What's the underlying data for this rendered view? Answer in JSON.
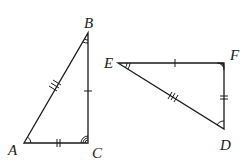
{
  "figure": {
    "triangle_1": {
      "name": "ABC",
      "vertices": {
        "A": {
          "label": "A",
          "x": 24,
          "y": 143
        },
        "B": {
          "label": "B",
          "x": 88,
          "y": 33
        },
        "C": {
          "label": "C",
          "x": 88,
          "y": 143
        }
      },
      "side_ticks": {
        "AB": 3,
        "BC": 1,
        "AC": 2
      },
      "angle_arcs": {
        "A": 1,
        "B": 1,
        "C": 3
      }
    },
    "triangle_2": {
      "name": "EFD",
      "vertices": {
        "E": {
          "label": "E",
          "x": 118,
          "y": 63
        },
        "F": {
          "label": "F",
          "x": 224,
          "y": 63
        },
        "D": {
          "label": "D",
          "x": 224,
          "y": 129
        }
      },
      "side_ticks": {
        "EF": 1,
        "FD": 2,
        "ED": 3
      },
      "angle_arcs": {
        "E": 2,
        "F": 3,
        "D": 1
      }
    },
    "labels": {
      "A": "A",
      "B": "B",
      "C": "C",
      "D": "D",
      "E": "E",
      "F": "F"
    },
    "colors": {
      "stroke": "#1a1a1a",
      "background": "#ffffff"
    }
  }
}
